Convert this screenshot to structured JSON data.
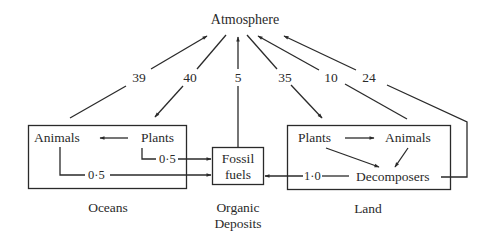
{
  "diagram": {
    "type": "carbon-cycle-flow",
    "nodes": {
      "atmosphere": "Atmosphere",
      "oceans": {
        "label": "Oceans",
        "animals": "Animals",
        "plants": "Plants"
      },
      "fossil": {
        "line1": "Fossil",
        "line2": "fuels",
        "caption1": "Organic",
        "caption2": "Deposits"
      },
      "land": {
        "label": "Land",
        "plants": "Plants",
        "animals": "Animals",
        "decomposers": "Decomposers"
      }
    },
    "flows": [
      {
        "from": "Oceans",
        "to": "Atmosphere",
        "value": "39"
      },
      {
        "from": "Atmosphere",
        "to": "Oceans Plants",
        "value": "40"
      },
      {
        "from": "Fossil fuels",
        "to": "Atmosphere",
        "value": "5"
      },
      {
        "from": "Atmosphere",
        "to": "Land Plants",
        "value": "35"
      },
      {
        "from": "Land Animals",
        "to": "Atmosphere",
        "value": "10"
      },
      {
        "from": "Land Decomposers",
        "to": "Atmosphere",
        "value": "24"
      },
      {
        "from": "Ocean Plants",
        "to": "Fossil fuels",
        "value": "0·5"
      },
      {
        "from": "Ocean Animals",
        "to": "Fossil fuels",
        "value": "0·5"
      },
      {
        "from": "Land Decomposers",
        "to": "Fossil fuels",
        "value": "1·0"
      },
      {
        "from": "Ocean Plants",
        "to": "Ocean Animals",
        "value": ""
      },
      {
        "from": "Land Plants",
        "to": "Land Animals",
        "value": ""
      },
      {
        "from": "Land Plants",
        "to": "Decomposers",
        "value": ""
      },
      {
        "from": "Land Animals",
        "to": "Decomposers",
        "value": ""
      }
    ],
    "colors": {
      "line": "#2a2a2a",
      "background": "#ffffff"
    }
  }
}
